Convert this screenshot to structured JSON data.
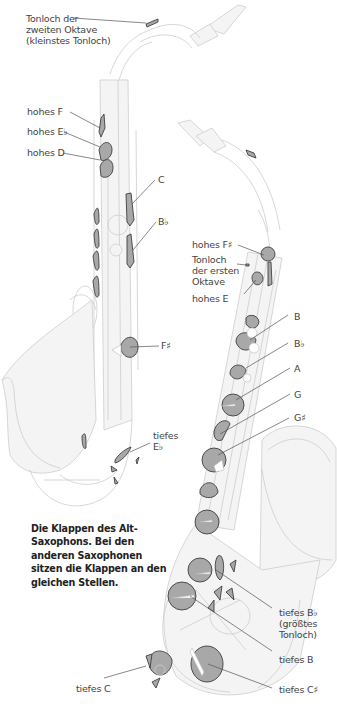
{
  "caption": "Die Klappen des Alt-Saxophons. Bei den anderen Saxophonen sitzen die Klappen an den gleichen Stellen.",
  "colors": {
    "key_fill": "#a9a9a9",
    "key_stroke": "#444444",
    "outline": "#cfcfcf",
    "leader": "#555555",
    "text": "#444444"
  },
  "labels_front": {
    "octave2_l1": "Tonloch der",
    "octave2_l2": "zweiten Oktave",
    "octave2_l3": "(kleinstes Tonloch)",
    "high_f": "hohes F",
    "high_eb": "hohes E♭",
    "high_d": "hohes D",
    "c": "C",
    "bb": "B♭",
    "fs": "F♯",
    "low_eb_l1": "tiefes",
    "low_eb_l2": "E♭"
  },
  "labels_side": {
    "high_fs": "hohes F♯",
    "octave1_l1": "Tonloch",
    "octave1_l2": "der ersten",
    "octave1_l3": "Oktave",
    "high_e": "hohes E",
    "b": "B",
    "bb": "B♭",
    "a": "A",
    "g": "G",
    "gs": "G♯",
    "low_bb_l1": "tiefes B♭",
    "low_bb_l2": "(größtes",
    "low_bb_l3": "Tonloch)",
    "low_b": "tiefes B",
    "low_c": "tiefes C",
    "low_cs": "tiefes C♯"
  }
}
